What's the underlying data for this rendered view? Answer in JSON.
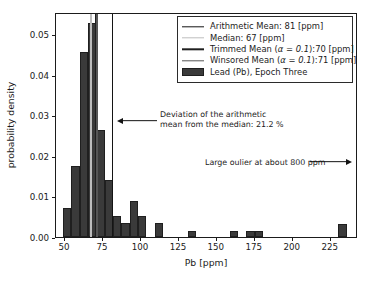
{
  "chart_data": {
    "type": "bar",
    "title": "",
    "xlabel": "Pb [ppm]",
    "ylabel": "probability density",
    "xlim": [
      44,
      243
    ],
    "ylim": [
      0.0,
      0.0555
    ],
    "grid": false,
    "legend_position": "upper right",
    "xticks": [
      50,
      75,
      100,
      125,
      150,
      175,
      200,
      225
    ],
    "xtick_labels": [
      "50",
      "75",
      "100",
      "125",
      "150",
      "175",
      "200",
      "225"
    ],
    "yticks": [
      0.0,
      0.01,
      0.02,
      0.03,
      0.04,
      0.05
    ],
    "ytick_labels": [
      "0.00",
      "0.01",
      "0.02",
      "0.03",
      "0.04",
      "0.05"
    ],
    "series_name": "Lead (Pb), Epoch Three",
    "bar_color": "#3a3a3a",
    "bin_edges": [
      48.5,
      54.0,
      59.5,
      65.0,
      70.5,
      76.0,
      81.5,
      87.0,
      92.5,
      98.0,
      103.5,
      109.0,
      114.5,
      120.0,
      125.5,
      131.0,
      136.5,
      142.0,
      147.5,
      153.0,
      158.5,
      164.0,
      169.5,
      175.0,
      180.5,
      186.0,
      191.5,
      197.0,
      202.5,
      208.0,
      213.5,
      219.0,
      224.5,
      230.0,
      235.5
    ],
    "bars": [
      {
        "x0": 48.5,
        "x1": 54.0,
        "height": 0.0071
      },
      {
        "x0": 54.0,
        "x1": 59.5,
        "height": 0.0175
      },
      {
        "x0": 59.5,
        "x1": 65.0,
        "height": 0.0456
      },
      {
        "x0": 65.0,
        "x1": 70.5,
        "height": 0.0528
      },
      {
        "x0": 70.5,
        "x1": 76.0,
        "height": 0.0263
      },
      {
        "x0": 76.0,
        "x1": 81.5,
        "height": 0.014
      },
      {
        "x0": 81.5,
        "x1": 87.0,
        "height": 0.0053
      },
      {
        "x0": 87.0,
        "x1": 92.5,
        "height": 0.0035
      },
      {
        "x0": 92.5,
        "x1": 98.0,
        "height": 0.0088
      },
      {
        "x0": 98.0,
        "x1": 103.5,
        "height": 0.0053
      },
      {
        "x0": 109.0,
        "x1": 114.5,
        "height": 0.0035
      },
      {
        "x0": 131.0,
        "x1": 136.5,
        "height": 0.0016
      },
      {
        "x0": 158.5,
        "x1": 164.0,
        "height": 0.0016
      },
      {
        "x0": 169.5,
        "x1": 175.0,
        "height": 0.0016
      },
      {
        "x0": 175.0,
        "x1": 180.5,
        "height": 0.0016
      },
      {
        "x0": 230.0,
        "x1": 235.5,
        "height": 0.0032
      }
    ],
    "vlines": [
      {
        "name": "arithmetic-mean",
        "x": 81,
        "color": "#141414"
      },
      {
        "name": "median",
        "x": 67,
        "color": "#bdbdbd"
      },
      {
        "name": "trimmed-mean",
        "x": 70,
        "color": "#1f1f1f"
      },
      {
        "name": "winsored-mean",
        "x": 71,
        "color": "#555555"
      }
    ],
    "annotations": [
      {
        "name": "deviation-annotation",
        "text": "Deviation of the arithmetic\nmean from the median: 21.2 %",
        "arrow_direction": "left"
      },
      {
        "name": "outlier-annotation",
        "text": "Large oulier at about 800 ppm",
        "arrow_direction": "right"
      }
    ]
  },
  "legend": {
    "items": [
      {
        "label": "Arithmetic Mean: 81 [ppm]",
        "handle": "line",
        "color": "#141414",
        "name": "legend-arithmetic-mean"
      },
      {
        "label": "Median: 67 [ppm]",
        "handle": "line",
        "color": "#bdbdbd",
        "name": "legend-median"
      },
      {
        "label_pre": "Trimmed Mean (",
        "label_alpha": "α = 0.1",
        "label_post": "):70 [ppm]",
        "handle": "line",
        "color": "#1f1f1f",
        "name": "legend-trimmed-mean"
      },
      {
        "label_pre": "Winsored Mean (",
        "label_alpha": "α = 0.1",
        "label_post": "):71 [ppm]",
        "handle": "line",
        "color": "#555555",
        "name": "legend-winsored-mean"
      },
      {
        "label": "Lead (Pb), Epoch Three",
        "handle": "patch",
        "color": "#3a3a3a",
        "name": "legend-histogram-patch"
      }
    ]
  },
  "axes": {
    "xlabel": "Pb [ppm]",
    "ylabel": "probability density"
  }
}
